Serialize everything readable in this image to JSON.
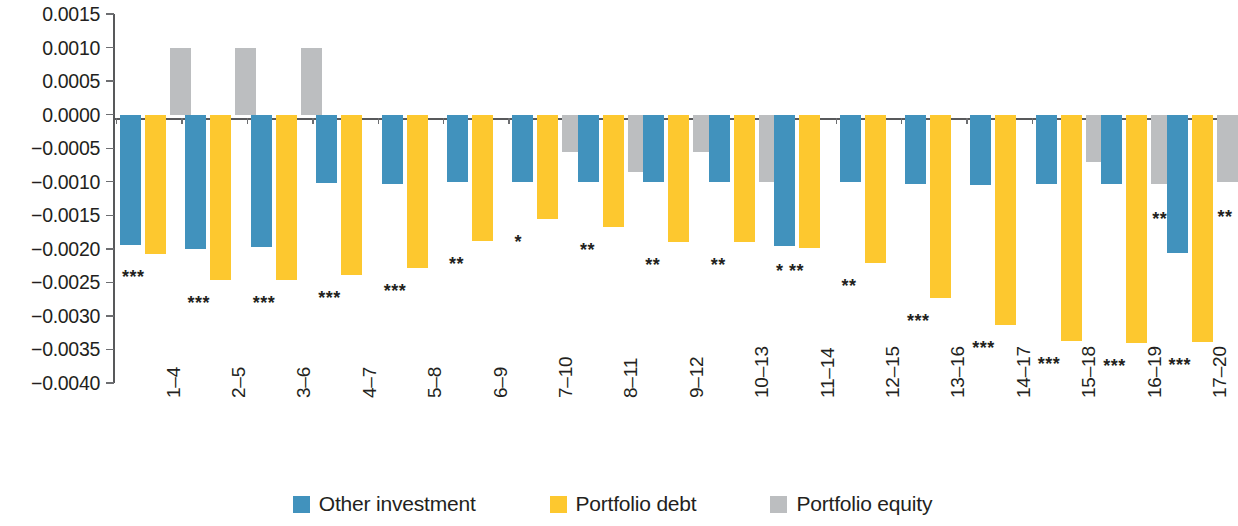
{
  "chart_data": {
    "type": "bar",
    "title": "",
    "subtitle": "",
    "xlabel": "",
    "ylabel": "",
    "ylim": [
      -0.004,
      0.0015
    ],
    "ytick_step": 0.0005,
    "grid": false,
    "legend_position": "bottom-center",
    "orientation": "vertical-grouped",
    "yticks": [
      0.0015,
      0.001,
      0.0005,
      0.0,
      -0.0005,
      -0.001,
      -0.0015,
      -0.002,
      -0.0025,
      -0.003,
      -0.0035,
      -0.004
    ],
    "ytick_labels": [
      "0.0015",
      "0.0010",
      "0.0005",
      "0.0000",
      "−0.0005",
      "−0.0010",
      "−0.0015",
      "−0.0020",
      "−0.0025",
      "−0.0030",
      "−0.0035",
      "−0.0040"
    ],
    "categories": [
      "1–4",
      "2–5",
      "3–6",
      "4–7",
      "5–8",
      "6–9",
      "7–10",
      "8–11",
      "9–12",
      "10–13",
      "11–14",
      "12–15",
      "13–16",
      "14–17",
      "15–18",
      "16–19",
      "17–20"
    ],
    "series": [
      {
        "name": "Other investment",
        "color": "#4192bd",
        "values": [
          -0.00195,
          -0.002,
          -0.00198,
          -0.00102,
          -0.00103,
          -0.001,
          -0.001,
          -0.00101,
          -0.001,
          -0.001,
          -0.00196,
          -0.001,
          -0.00103,
          -0.00105,
          -0.00104,
          -0.00104,
          -0.00206
        ]
      },
      {
        "name": "Portfolio debt",
        "color": "#fdc82f",
        "values": [
          -0.00208,
          -0.00247,
          -0.00247,
          -0.00239,
          -0.00229,
          -0.00189,
          -0.00155,
          -0.00167,
          -0.0019,
          -0.0019,
          -0.00199,
          -0.00221,
          -0.00273,
          -0.00313,
          -0.00337,
          -0.0034,
          -0.00339
        ]
      },
      {
        "name": "Portfolio equity",
        "color": "#bcbec0",
        "values": [
          0.001,
          0.001,
          0.001,
          0.0,
          0.0,
          0.0,
          -0.00055,
          -0.00085,
          -0.00055,
          -0.001,
          0.0,
          0.0,
          0.0,
          0.0,
          -0.0007,
          -0.00104,
          -0.001
        ]
      }
    ],
    "significance": [
      {
        "category": "1–4",
        "marks": "***"
      },
      {
        "category": "2–5",
        "marks": "***"
      },
      {
        "category": "3–6",
        "marks": "***"
      },
      {
        "category": "4–7",
        "marks": "***"
      },
      {
        "category": "5–8",
        "marks": "***"
      },
      {
        "category": "6–9",
        "marks": "**"
      },
      {
        "category": "7–10",
        "marks": "*"
      },
      {
        "category": "8–11",
        "marks": "**"
      },
      {
        "category": "9–12",
        "marks": "**"
      },
      {
        "category": "10–13",
        "marks": "**"
      },
      {
        "category": "11–14",
        "marks": "* **"
      },
      {
        "category": "12–15",
        "marks": "**"
      },
      {
        "category": "13–16",
        "marks": "***"
      },
      {
        "category": "14–17",
        "marks": "***"
      },
      {
        "category": "15–18",
        "marks": "***"
      },
      {
        "category": "16–19",
        "marks": "***"
      },
      {
        "category": "17–20",
        "marks": "***"
      }
    ],
    "significance_equity": [
      {
        "category": "16–19",
        "marks": "**"
      },
      {
        "category": "17–20",
        "marks": "**"
      }
    ],
    "legend": [
      {
        "label": "Other investment",
        "color": "#4192bd"
      },
      {
        "label": "Portfolio debt",
        "color": "#fdc82f"
      },
      {
        "label": "Portfolio equity",
        "color": "#bcbec0"
      }
    ]
  }
}
